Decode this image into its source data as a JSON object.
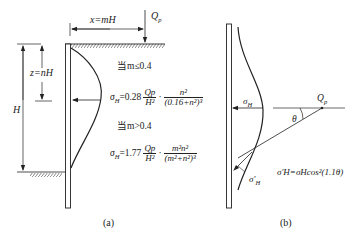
{
  "panel_a": {
    "caption": "(a)",
    "dim_x": "x=mH",
    "dim_z": "z=nH",
    "dim_H": "H",
    "load": "Q",
    "load_sub": "p",
    "case1": "当m≤0.4",
    "case2": "当m>0.4",
    "formula1": {
      "lhs": "σ",
      "lhs_sub": "H",
      "coef": "=0.28",
      "frac1_num": "Qp",
      "frac1_den": "H²",
      "dot": "·",
      "frac2_num": "n²",
      "frac2_den": "(0.16+n²)³"
    },
    "formula2": {
      "lhs": "σ",
      "lhs_sub": "H",
      "coef": "=1.77",
      "frac1_num": "Qp",
      "frac1_den": "H²",
      "dot": "·",
      "frac2_num": "m²n²",
      "frac2_den": "(m²+n²)³"
    }
  },
  "panel_b": {
    "caption": "(b)",
    "sigma_label": "σ",
    "sigma_sub": "H",
    "load": "Q",
    "load_sub": "p",
    "angle": "θ",
    "sigma_prime_label": "σ'",
    "sigma_prime_sub": "H",
    "formula": "σ'H=σHcos²(1.1θ)"
  }
}
